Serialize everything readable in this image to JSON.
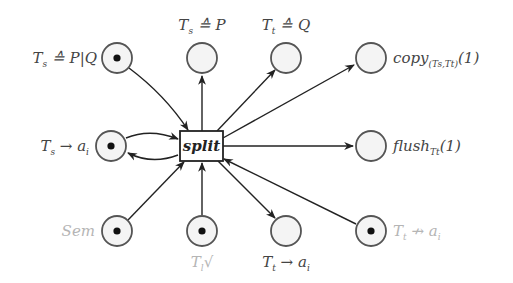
{
  "diagram": {
    "type": "petri-net",
    "transition": {
      "id": "split",
      "label": "split"
    },
    "places": [
      {
        "id": "ts-eq-pq",
        "label": "Ts ≙ P|Q",
        "label_parts": [
          "T",
          "s",
          " ≙ P|Q"
        ],
        "token": true,
        "faded_label": false
      },
      {
        "id": "ts-eq-p",
        "label": "Ts ≙ P",
        "label_parts": [
          "T",
          "s",
          " ≙ P"
        ],
        "token": false,
        "faded_label": false
      },
      {
        "id": "tt-eq-q",
        "label": "Tt ≙ Q",
        "label_parts": [
          "T",
          "t",
          " ≙ Q"
        ],
        "token": false,
        "faded_label": false
      },
      {
        "id": "copy",
        "label": "copy(Ts,Tt)(1)",
        "label_parts": [
          "copy",
          "(Ts,Tt)",
          "(1)"
        ],
        "token": false,
        "faded_label": false
      },
      {
        "id": "ts-to-ai",
        "label": "Ts → ai",
        "label_parts": [
          "T",
          "s",
          " → a",
          "i"
        ],
        "token": true,
        "faded_label": true
      },
      {
        "id": "flush",
        "label": "flushTt(1)",
        "label_parts": [
          "flush",
          "Tt",
          "(1)"
        ],
        "token": false,
        "faded_label": false
      },
      {
        "id": "sem",
        "label": "Sem",
        "label_parts": [
          "Sem"
        ],
        "token": true,
        "faded_label": true
      },
      {
        "id": "tl-done",
        "label": "Tl√",
        "label_parts": [
          "T",
          "l",
          "√"
        ],
        "token": true,
        "faded_label": true
      },
      {
        "id": "tt-to-ai",
        "label": "Tt → ai",
        "label_parts": [
          "T",
          "t",
          " → a",
          "i"
        ],
        "token": false,
        "faded_label": false
      },
      {
        "id": "tt-not-ai",
        "label": "Tt ↛ ai",
        "label_parts": [
          "T",
          "t",
          " ↛ a",
          "i"
        ],
        "token": true,
        "faded_label": true
      }
    ],
    "arcs": [
      {
        "from": "ts-eq-pq",
        "to": "split"
      },
      {
        "from": "split",
        "to": "ts-eq-p"
      },
      {
        "from": "split",
        "to": "tt-eq-q"
      },
      {
        "from": "split",
        "to": "copy"
      },
      {
        "from": "ts-to-ai",
        "to": "split"
      },
      {
        "from": "split",
        "to": "ts-to-ai"
      },
      {
        "from": "split",
        "to": "flush"
      },
      {
        "from": "sem",
        "to": "split"
      },
      {
        "from": "tl-done",
        "to": "split"
      },
      {
        "from": "split",
        "to": "tt-to-ai"
      },
      {
        "from": "tt-not-ai",
        "to": "split"
      }
    ]
  }
}
